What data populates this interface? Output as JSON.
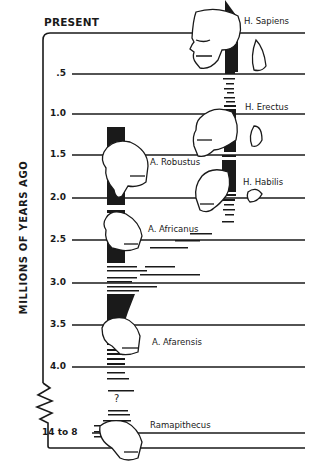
{
  "diagram": {
    "title_top": "PRESENT",
    "axis_label": "MILLIONS OF YEARS AGO",
    "ticks": [
      {
        "label": ".5",
        "y": 74
      },
      {
        "label": "1.0",
        "y": 114
      },
      {
        "label": "1.5",
        "y": 155
      },
      {
        "label": "2.0",
        "y": 198
      },
      {
        "label": "2.5",
        "y": 240
      },
      {
        "label": "3.0",
        "y": 283
      },
      {
        "label": "3.5",
        "y": 325
      },
      {
        "label": "4.0",
        "y": 367
      },
      {
        "label": "14 to 8",
        "y": 433
      }
    ],
    "species": [
      {
        "name": "H. Sapiens"
      },
      {
        "name": "H. Erectus"
      },
      {
        "name": "A. Robustus"
      },
      {
        "name": "H. Habilis"
      },
      {
        "name": "A. Africanus"
      },
      {
        "name": "A. Afarensis"
      },
      {
        "name": "Ramapithecus"
      }
    ],
    "uncertain_mark": "?",
    "colors": {
      "ink": "#1a1a1a",
      "background": "#ffffff"
    }
  }
}
